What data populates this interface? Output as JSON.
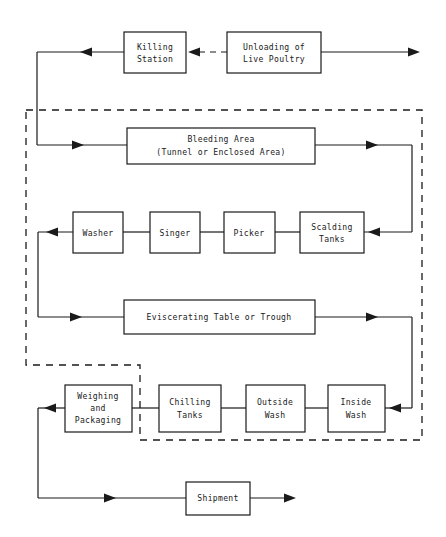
{
  "diagram": {
    "type": "process-flowchart",
    "line_color": "#1a1a1a",
    "background_color": "#ffffff",
    "nodes": {
      "killing_station": {
        "line1": "Killing",
        "line2": "Station"
      },
      "unloading": {
        "line1": "Unloading of",
        "line2": "Live Poultry"
      },
      "bleeding_area": {
        "line1": "Bleeding Area",
        "line2": "(Tunnel or Enclosed Area)"
      },
      "washer": {
        "line1": "Washer"
      },
      "singer": {
        "line1": "Singer"
      },
      "picker": {
        "line1": "Picker"
      },
      "scalding_tanks": {
        "line1": "Scalding",
        "line2": "Tanks"
      },
      "eviscerating": {
        "line1": "Eviscerating Table or Trough"
      },
      "weighing_packaging": {
        "line1": "Weighing",
        "line2": "and",
        "line3": "Packaging"
      },
      "chilling_tanks": {
        "line1": "Chilling",
        "line2": "Tanks"
      },
      "outside_wash": {
        "line1": "Outside",
        "line2": "Wash"
      },
      "inside_wash": {
        "line1": "Inside",
        "line2": "Wash"
      },
      "shipment": {
        "line1": "Shipment"
      }
    }
  }
}
